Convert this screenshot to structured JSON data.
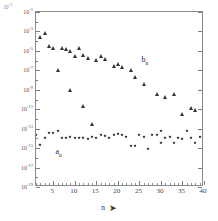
{
  "chart_data": {
    "type": "scatter",
    "title": "",
    "subtitle": "",
    "xlabel": "n",
    "xlabel_arrow": "➤",
    "ylabel": "",
    "y_scale": "log",
    "ylim": [
      1e-19,
      0.1
    ],
    "xlim": [
      1,
      40
    ],
    "grid": false,
    "legend_position": "inline-annotation",
    "corner_annotation": "10⁻³",
    "y_ticks": [
      {
        "value": 0.1,
        "label": "10",
        "exponent": "-1"
      },
      {
        "value": 0.001,
        "label": "10",
        "exponent": "-3"
      },
      {
        "value": 1e-05,
        "label": "10",
        "exponent": "-5"
      },
      {
        "value": 1e-07,
        "label": "10",
        "exponent": "-7"
      },
      {
        "value": 1e-09,
        "label": "10",
        "exponent": "-9"
      },
      {
        "value": 1e-11,
        "label": "10",
        "exponent": "-11"
      },
      {
        "value": 1e-13,
        "label": "10",
        "exponent": "-13"
      },
      {
        "value": 1e-15,
        "label": "10",
        "exponent": "-15"
      },
      {
        "value": 1e-17,
        "label": "10",
        "exponent": "-17"
      },
      {
        "value": 1e-19,
        "label": "10",
        "exponent": "-19"
      }
    ],
    "x_ticks": [
      5,
      10,
      15,
      20,
      25,
      30,
      35,
      40
    ],
    "x_tick_minor_step": 1,
    "series": [
      {
        "name": "b_n",
        "label": "b",
        "label_sub": "n",
        "marker": "triangle",
        "color": "#333333",
        "annotation_x": 25.5,
        "annotation_y": 3e-06,
        "points": [
          {
            "x": 2,
            "y": 0.0003
          },
          {
            "x": 3,
            "y": 0.0007
          },
          {
            "x": 4,
            "y": 3e-05
          },
          {
            "x": 5,
            "y": 2e-05
          },
          {
            "x": 6,
            "y": 1.1e-07
          },
          {
            "x": 7,
            "y": 2e-05
          },
          {
            "x": 8,
            "y": 1.5e-05
          },
          {
            "x": 9,
            "y": 9e-06
          },
          {
            "x": 9,
            "y": 9e-10
          },
          {
            "x": 10,
            "y": 3e-06
          },
          {
            "x": 11,
            "y": 2e-05
          },
          {
            "x": 12,
            "y": 2e-11
          },
          {
            "x": 12,
            "y": 4e-06
          },
          {
            "x": 13,
            "y": 2e-06
          },
          {
            "x": 14,
            "y": 3e-13
          },
          {
            "x": 15,
            "y": 1.2e-06
          },
          {
            "x": 16,
            "y": 3e-06
          },
          {
            "x": 17,
            "y": 1.5e-06
          },
          {
            "x": 19,
            "y": 3e-07
          },
          {
            "x": 20,
            "y": 4e-07
          },
          {
            "x": 21,
            "y": 2e-07
          },
          {
            "x": 23,
            "y": 1.2e-07
          },
          {
            "x": 24,
            "y": 2e-08
          },
          {
            "x": 26,
            "y": 4e-09
          },
          {
            "x": 29,
            "y": 4e-10
          },
          {
            "x": 31,
            "y": 2e-10
          },
          {
            "x": 33,
            "y": 4e-10
          },
          {
            "x": 35,
            "y": 3e-12
          },
          {
            "x": 37,
            "y": 1.5e-11
          },
          {
            "x": 38,
            "y": 8e-12
          }
        ]
      },
      {
        "name": "a_n",
        "label": "a",
        "label_sub": "n",
        "marker": "diamond",
        "color": "#2b2b2b",
        "annotation_x": 5.5,
        "annotation_y": 1e-15,
        "points": [
          {
            "x": 1,
            "y": 2e-14
          },
          {
            "x": 2,
            "y": 2e-15
          },
          {
            "x": 3,
            "y": 1e-14
          },
          {
            "x": 4,
            "y": 4e-14
          },
          {
            "x": 5,
            "y": 4e-14
          },
          {
            "x": 6,
            "y": 6e-14
          },
          {
            "x": 7,
            "y": 1.2e-14
          },
          {
            "x": 8,
            "y": 1e-14
          },
          {
            "x": 9,
            "y": 1.5e-14
          },
          {
            "x": 10,
            "y": 1e-14
          },
          {
            "x": 11,
            "y": 1e-14
          },
          {
            "x": 12,
            "y": 1.2e-14
          },
          {
            "x": 13,
            "y": 8e-15
          },
          {
            "x": 14,
            "y": 1.5e-14
          },
          {
            "x": 15,
            "y": 1e-14
          },
          {
            "x": 16,
            "y": 2.5e-14
          },
          {
            "x": 17,
            "y": 1.8e-14
          },
          {
            "x": 18,
            "y": 1.2e-14
          },
          {
            "x": 19,
            "y": 2.2e-14
          },
          {
            "x": 20,
            "y": 3e-14
          },
          {
            "x": 21,
            "y": 2e-14
          },
          {
            "x": 22,
            "y": 1.5e-14
          },
          {
            "x": 23,
            "y": 1.5e-15
          },
          {
            "x": 24,
            "y": 1.8e-15
          },
          {
            "x": 25,
            "y": 2e-14
          },
          {
            "x": 26,
            "y": 1.5e-14
          },
          {
            "x": 27,
            "y": 8e-16
          },
          {
            "x": 28,
            "y": 2.5e-14
          },
          {
            "x": 29,
            "y": 2e-14
          },
          {
            "x": 30,
            "y": 3e-15
          },
          {
            "x": 30,
            "y": 6e-14
          },
          {
            "x": 31,
            "y": 1.2e-14
          },
          {
            "x": 32,
            "y": 1.5e-14
          },
          {
            "x": 33,
            "y": 3e-15
          },
          {
            "x": 34,
            "y": 1e-14
          },
          {
            "x": 35,
            "y": 8e-15
          },
          {
            "x": 36,
            "y": 6e-14
          },
          {
            "x": 37,
            "y": 1.2e-14
          },
          {
            "x": 38,
            "y": 3e-15
          },
          {
            "x": 39,
            "y": 1.5e-14
          },
          {
            "x": 40,
            "y": 5e-14
          }
        ]
      }
    ]
  }
}
